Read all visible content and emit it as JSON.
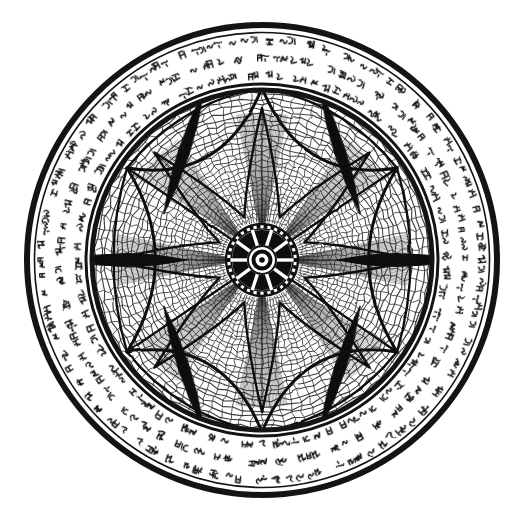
{
  "artwork": {
    "title": "Circular Mandala with Script Border",
    "medium": "ink-drawing",
    "background_color": "#ffffff",
    "ink_color": "#111111",
    "canvas": {
      "width": 527,
      "height": 520
    },
    "center": {
      "x": 262,
      "y": 260
    }
  },
  "rings": {
    "outer_rim": {
      "label": "outer rim circle",
      "radius": 235,
      "stroke_width": 6,
      "color": "#141414"
    },
    "script_band": {
      "label": "pseudo-script glyph band",
      "outer_radius": 229,
      "inner_radius": 176,
      "glyph_count": 520,
      "color": "#151515",
      "description": "dense band of illegible rune-like cursive glyphs in three concentric rows"
    },
    "inner_rim": {
      "label": "inner disc rim",
      "radius": 170,
      "stroke_width": 5,
      "color": "#141414"
    }
  },
  "mesh": {
    "label": "radial web lattice",
    "spoke_count": 96,
    "ring_count": 26,
    "color": "#2b2b2b",
    "stroke_width": 0.9,
    "jitter": "hand-drawn wobble"
  },
  "hexframe": {
    "label": "hexagonal frame",
    "vertices": [
      {
        "name": "top",
        "x": 262,
        "y": 88
      },
      {
        "name": "upper-right",
        "x": 397,
        "y": 168
      },
      {
        "name": "lower-right",
        "x": 397,
        "y": 352
      },
      {
        "name": "bottom",
        "x": 262,
        "y": 432
      },
      {
        "name": "lower-left",
        "x": 127,
        "y": 352
      },
      {
        "name": "upper-left",
        "x": 127,
        "y": 168
      }
    ],
    "color": "#111111",
    "stroke_width": 3
  },
  "lenses": {
    "label": "dark vesica lens shapes",
    "count": 6,
    "fill": "#0d0d0d",
    "items": [
      {
        "name": "lens-left",
        "angle_deg": 180,
        "distance": 135,
        "length": 120,
        "width": 26,
        "rotation": 90
      },
      {
        "name": "lens-right",
        "angle_deg": 0,
        "distance": 135,
        "length": 120,
        "width": 26,
        "rotation": 90
      },
      {
        "name": "lens-upper-left",
        "angle_deg": 234,
        "distance": 133,
        "length": 130,
        "width": 22,
        "rotation": 18
      },
      {
        "name": "lens-upper-right",
        "angle_deg": 306,
        "distance": 133,
        "length": 130,
        "width": 22,
        "rotation": -18
      },
      {
        "name": "lens-lower-left",
        "angle_deg": 126,
        "distance": 133,
        "length": 130,
        "width": 22,
        "rotation": -18
      },
      {
        "name": "lens-lower-right",
        "angle_deg": 54,
        "distance": 133,
        "length": 130,
        "width": 22,
        "rotation": 18
      }
    ]
  },
  "star": {
    "label": "eight pointed star",
    "points": 8,
    "outer_radius": 152,
    "inner_radius": 46,
    "concavity": 0.55,
    "color": "#111111",
    "stroke_width": 2.4,
    "shading": "fine radial hatching inside each point"
  },
  "hub": {
    "label": "central wheel hub",
    "outer_radius": 36,
    "bead_ring_radius": 31,
    "bead_count": 30,
    "spoke_count": 10,
    "inner_radius": 14,
    "core_radius": 5,
    "color": "#111111",
    "fill": "#0e0e0e"
  },
  "labels": {
    "figure_caption": "",
    "alt_text": "A symmetric black-and-white circular mandala: an outer double ring enclosing a band of dense rune-like script, an inner disc filled with a fine woven lattice, a hexagonal frame, six dark lens shapes, an eight-pointed star and a spoked wheel hub at the centre."
  }
}
